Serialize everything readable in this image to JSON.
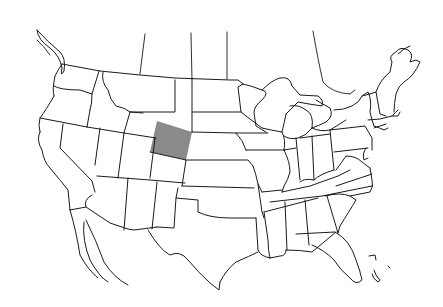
{
  "map": {
    "type": "outline-map",
    "region": "United States (contiguous) with southern Canada border lines and northern Mexico coast",
    "style": "black line drawing on white background",
    "highlighted_region": {
      "name": "Wyoming",
      "fill_color": "#8a8a8a"
    },
    "background_color": "#ffffff",
    "line_color": "#1a1a1a",
    "visible_text": []
  }
}
